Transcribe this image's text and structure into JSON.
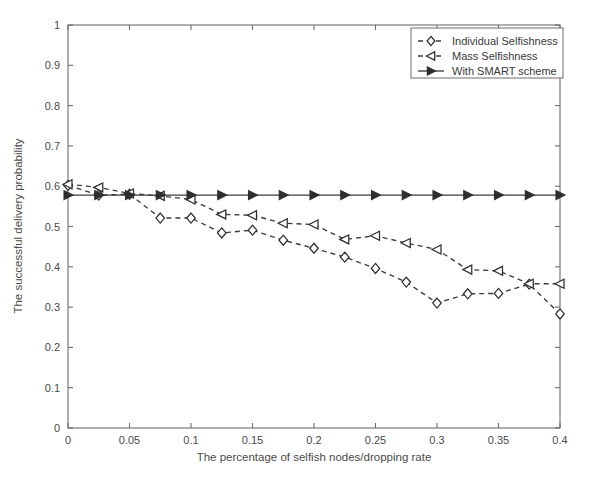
{
  "chart_data": {
    "type": "line",
    "title": "",
    "xlabel": "The percentage of selfish nodes/dropping rate",
    "ylabel": "The successful delivery probability",
    "xlim": [
      0,
      0.4
    ],
    "ylim": [
      0,
      1
    ],
    "grid": false,
    "legend_position": "top-right",
    "xticks": [
      0,
      0.05,
      0.1,
      0.15,
      0.2,
      0.25,
      0.3,
      0.35,
      0.4
    ],
    "xtick_labels": [
      "0",
      "0.05",
      "0.1",
      "0.15",
      "0.2",
      "0.25",
      "0.3",
      "0.35",
      "0.4"
    ],
    "yticks": [
      0,
      0.1,
      0.2,
      0.3,
      0.4,
      0.5,
      0.6,
      0.7,
      0.8,
      0.9,
      1
    ],
    "ytick_labels": [
      "0",
      "0.1",
      "0.2",
      "0.3",
      "0.4",
      "0.5",
      "0.6",
      "0.7",
      "0.8",
      "0.9",
      "1"
    ],
    "x": [
      0,
      0.025,
      0.05,
      0.075,
      0.1,
      0.125,
      0.15,
      0.175,
      0.2,
      0.225,
      0.25,
      0.275,
      0.3,
      0.325,
      0.35,
      0.375,
      0.4
    ],
    "series": [
      {
        "name": "Individual Selfishness",
        "marker": "diamond-open",
        "linestyle": "dashed",
        "color": "#2e2e2e",
        "values": [
          0.602,
          0.578,
          0.58,
          0.521,
          0.521,
          0.484,
          0.491,
          0.466,
          0.446,
          0.424,
          0.396,
          0.362,
          0.31,
          0.333,
          0.334,
          0.357,
          0.283
        ]
      },
      {
        "name": "Mass Selfishness",
        "marker": "left-triangle-open",
        "linestyle": "dashed",
        "color": "#2e2e2e",
        "values": [
          0.605,
          0.597,
          0.582,
          0.576,
          0.567,
          0.53,
          0.528,
          0.508,
          0.505,
          0.468,
          0.477,
          0.459,
          0.443,
          0.393,
          0.39,
          0.358,
          0.358
        ]
      },
      {
        "name": "With SMART scheme",
        "marker": "right-triangle-filled",
        "linestyle": "solid",
        "color": "#2e2e2e",
        "values": [
          0.578,
          0.578,
          0.578,
          0.578,
          0.578,
          0.578,
          0.578,
          0.578,
          0.578,
          0.578,
          0.578,
          0.578,
          0.578,
          0.578,
          0.578,
          0.578,
          0.578
        ]
      }
    ]
  },
  "legend": {
    "items": [
      {
        "label": "Individual Selfishness",
        "marker": "diamond-open"
      },
      {
        "label": "Mass Selfishness",
        "marker": "left-triangle-open"
      },
      {
        "label": "With SMART scheme",
        "marker": "right-triangle-filled"
      }
    ]
  }
}
